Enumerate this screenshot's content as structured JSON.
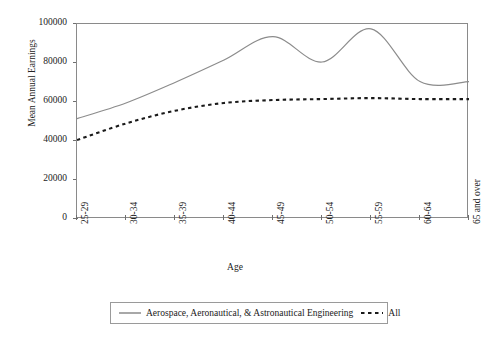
{
  "chart_data": {
    "type": "line",
    "title": "",
    "xlabel": "Age",
    "ylabel": "Mean Annual Earnings",
    "categories": [
      "25-29",
      "30-34",
      "35-39",
      "40-44",
      "45-49",
      "50-54",
      "55-59",
      "60-64",
      "65 and over"
    ],
    "ylim": [
      0,
      100000
    ],
    "yticks": [
      0,
      20000,
      40000,
      60000,
      80000,
      100000
    ],
    "ytick_labels": [
      "0",
      "20000",
      "40000",
      "60000",
      "80000",
      "100000"
    ],
    "grid": false,
    "smoothing": "spline",
    "legend_position": "bottom",
    "series": [
      {
        "name": "Aerospace, Aeronautical, & Astronautical Engineering",
        "style": "solid",
        "color": "#8c8c8c",
        "values": [
          51500,
          59500,
          70000,
          81500,
          93500,
          80500,
          97500,
          70500,
          70500
        ]
      },
      {
        "name": "All",
        "style": "dashed",
        "color": "#1a1a1a",
        "values": [
          40500,
          49000,
          55500,
          59500,
          61000,
          61500,
          62000,
          61500,
          61500
        ]
      }
    ]
  },
  "axes": {
    "y_title": "Mean Annual Earnings",
    "x_title": "Age"
  },
  "legend": {
    "items": [
      {
        "label": "Aerospace, Aeronautical, & Astronautical Engineering",
        "style": "solid"
      },
      {
        "label": "All",
        "style": "dashed"
      }
    ]
  },
  "colors": {
    "series_aerospace": "#8c8c8c",
    "series_all": "#1a1a1a",
    "axis": "#8a8a8a",
    "background": "#ffffff"
  }
}
